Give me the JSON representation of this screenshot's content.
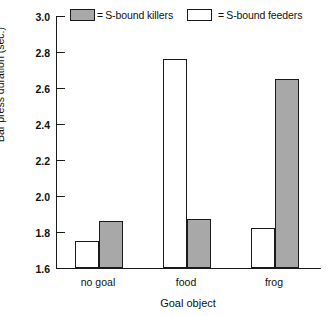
{
  "chart_data": {
    "type": "bar",
    "title": "",
    "xlabel": "Goal object",
    "ylabel": "Bar press duration (sec.)",
    "categories": [
      "no goal",
      "food",
      "frog"
    ],
    "ylim": [
      1.6,
      3.0
    ],
    "yticks": [
      "3.0",
      "2.8",
      "2.6",
      "2.4",
      "2.2",
      "2.0",
      "1.8",
      "1.6"
    ],
    "ytick_values": [
      3.0,
      2.8,
      2.6,
      2.4,
      2.2,
      2.0,
      1.8,
      1.6
    ],
    "grid": false,
    "legend_position": "top",
    "series": [
      {
        "name": "S-bound feeders",
        "color": "#ffffff",
        "values": [
          1.75,
          2.76,
          1.82
        ]
      },
      {
        "name": "S-bound killers",
        "color": "#a8a8a8",
        "values": [
          1.86,
          1.87,
          2.65
        ]
      }
    ],
    "bar_order_in_group": [
      "S-bound feeders",
      "S-bound killers"
    ],
    "annotations": []
  },
  "legend": {
    "killers": {
      "equals": "=",
      "label": "S-bound killers",
      "swatch_color": "#a8a8a8"
    },
    "feeders": {
      "equals": "=",
      "label": "S-bound feeders",
      "swatch_color": "#ffffff"
    }
  },
  "axes": {
    "y_label": "Bar press duration (sec.)",
    "x_label": "Goal object",
    "y_ticks": [
      "3.0",
      "2.8",
      "2.6",
      "2.4",
      "2.2",
      "2.0",
      "1.8",
      "1.6"
    ],
    "x_categories": [
      "no goal",
      "food",
      "frog"
    ],
    "axis_color": "#1a1a1a"
  }
}
